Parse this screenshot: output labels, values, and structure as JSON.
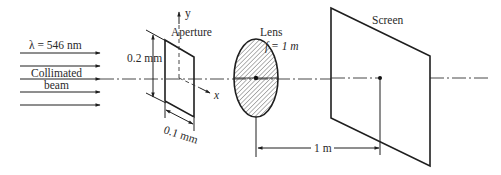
{
  "diagram": {
    "type": "optics-setup",
    "beam": {
      "wavelength_label": "λ = 546 nm",
      "label_line1": "Collimated",
      "label_line2": "beam",
      "arrow_count": 5
    },
    "aperture": {
      "label": "Aperture",
      "height_label": "0.2 mm",
      "width_label": "0.1 mm",
      "y_axis_label": "y",
      "x_axis_label": "x"
    },
    "lens": {
      "label": "Lens",
      "focal_label": "f = 1 m"
    },
    "screen": {
      "label": "Screen"
    },
    "distance": {
      "label": "1 m"
    },
    "colors": {
      "line": "#1e1e1e",
      "text": "#2a2a2a",
      "background": "#ffffff"
    }
  }
}
